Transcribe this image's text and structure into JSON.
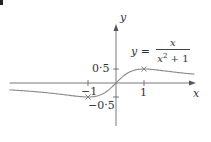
{
  "corner_mark": "question-number-fragment",
  "chart_data": {
    "type": "line",
    "title": "",
    "function_label": {
      "lhs": "y =",
      "numerator": "x",
      "denominator_base": "x",
      "denominator_exp": "2",
      "denominator_rest": " + 1"
    },
    "xlabel": "x",
    "ylabel": "y",
    "x_ticks": [
      {
        "value": -1,
        "label": "−1"
      },
      {
        "value": 1,
        "label": "1"
      }
    ],
    "y_ticks": [
      {
        "value": 0.5,
        "label": "0·5"
      },
      {
        "value": -0.5,
        "label": "−0·5"
      }
    ],
    "xlim": [
      -3.8,
      2.8
    ],
    "ylim": [
      -1.5,
      2.1
    ],
    "grid": false,
    "legend": null,
    "series": [
      {
        "name": "y = x/(x^2+1)",
        "function": "x/(x^2+1)",
        "x": [
          -3.8,
          -3,
          -2,
          -1.5,
          -1,
          -0.5,
          0,
          0.5,
          1,
          1.5,
          2,
          2.5,
          2.8
        ],
        "values": [
          -0.247,
          -0.3,
          -0.4,
          -0.462,
          -0.5,
          -0.4,
          0,
          0.4,
          0.5,
          0.462,
          0.4,
          0.345,
          0.317
        ]
      }
    ],
    "marked_points": [
      {
        "x": -1,
        "y": -0.5,
        "marker": "cross"
      },
      {
        "x": 1,
        "y": 0.5,
        "marker": "cross"
      }
    ],
    "colors": {
      "axis": "#555555",
      "curve": "#888888",
      "text": "#333333"
    }
  }
}
